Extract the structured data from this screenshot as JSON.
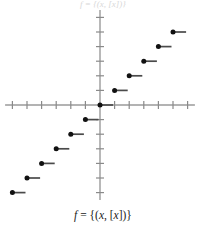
{
  "figure": {
    "top_partial_text": "f = {(x, [x])}",
    "caption": {
      "f": "f",
      "equals": " = {(",
      "x1": "x",
      "comma": ", [",
      "x2": "x",
      "close": "])}",
      "full": "f = {(x, [x])}"
    }
  },
  "colors": {
    "axis": "#9a9a9a",
    "tick": "#8a8a8a",
    "step_line": "#4a4a4a",
    "dot": "#111111",
    "background": "#ffffff",
    "caption_text": "#1a1a1a"
  },
  "chart_data": {
    "type": "line",
    "title": "f = {(x, [x])}",
    "subtitle": "",
    "xlabel": "",
    "ylabel": "",
    "function": "floor",
    "xlim": [
      -6.5,
      6.5
    ],
    "ylim": [
      -6.5,
      6.5
    ],
    "grid": false,
    "legend": null,
    "x_ticks": [
      -6,
      -5,
      -4,
      -3,
      -2,
      -1,
      0,
      1,
      2,
      3,
      4,
      5,
      6
    ],
    "y_ticks": [
      -6,
      -5,
      -4,
      -3,
      -2,
      -1,
      0,
      1,
      2,
      3,
      4,
      5,
      6
    ],
    "tick_labels_visible": false,
    "axis_arrows": false,
    "steps": [
      {
        "x_start": -6,
        "x_end": -5,
        "y": -6,
        "closed_left": true,
        "open_right": true
      },
      {
        "x_start": -5,
        "x_end": -4,
        "y": -5,
        "closed_left": true,
        "open_right": true
      },
      {
        "x_start": -4,
        "x_end": -3,
        "y": -4,
        "closed_left": true,
        "open_right": true
      },
      {
        "x_start": -3,
        "x_end": -2,
        "y": -3,
        "closed_left": true,
        "open_right": true
      },
      {
        "x_start": -2,
        "x_end": -1,
        "y": -2,
        "closed_left": true,
        "open_right": true
      },
      {
        "x_start": -1,
        "x_end": 0,
        "y": -1,
        "closed_left": true,
        "open_right": true
      },
      {
        "x_start": 0,
        "x_end": 1,
        "y": 0,
        "closed_left": true,
        "open_right": true
      },
      {
        "x_start": 1,
        "x_end": 2,
        "y": 1,
        "closed_left": true,
        "open_right": true
      },
      {
        "x_start": 2,
        "x_end": 3,
        "y": 2,
        "closed_left": true,
        "open_right": true
      },
      {
        "x_start": 3,
        "x_end": 4,
        "y": 3,
        "closed_left": true,
        "open_right": true
      },
      {
        "x_start": 4,
        "x_end": 5,
        "y": 4,
        "closed_left": true,
        "open_right": true
      },
      {
        "x_start": 5,
        "x_end": 6,
        "y": 5,
        "closed_left": true,
        "open_right": true
      }
    ],
    "series": [
      {
        "name": "floor(x)",
        "x": [
          -6,
          -5,
          -4,
          -3,
          -2,
          -1,
          0,
          1,
          2,
          3,
          4,
          5
        ],
        "values": [
          -6,
          -5,
          -4,
          -3,
          -2,
          -1,
          0,
          1,
          2,
          3,
          4,
          5
        ]
      }
    ]
  }
}
